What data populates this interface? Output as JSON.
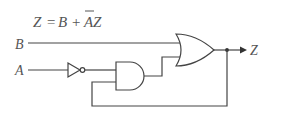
{
  "equation": {
    "lhs": "Z",
    "equals": "=",
    "term1": "B",
    "plus": "+",
    "term2_bar": "A",
    "term2_rest": "Z"
  },
  "inputs": {
    "b_label": "B",
    "a_label": "A"
  },
  "output": {
    "z_label": "Z"
  },
  "components": [
    {
      "type": "NOT",
      "input": "A",
      "output": "A'"
    },
    {
      "type": "AND",
      "inputs": [
        "A'",
        "Z (feedback)"
      ],
      "output": "A'Z"
    },
    {
      "type": "OR",
      "inputs": [
        "B",
        "A'Z"
      ],
      "output": "Z"
    }
  ],
  "colors": {
    "ink": "#444444",
    "label": "#555555",
    "background": "#ffffff"
  }
}
